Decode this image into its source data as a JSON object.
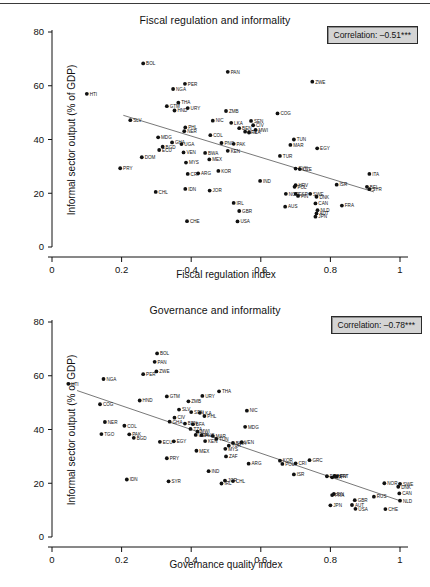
{
  "figure": {
    "top_rule": true,
    "background": "#ffffff",
    "ink": "#111111"
  },
  "chart_data": [
    {
      "type": "scatter",
      "id": "fiscal-regulation-informality",
      "title": "Fiscal regulation and informality",
      "xlabel": "Fiscal regulation index",
      "ylabel": "Informal sector output (% of GDP)",
      "xlim": [
        0,
        1
      ],
      "ylim": [
        0,
        80
      ],
      "xticks": [
        0,
        0.2,
        0.4,
        0.6,
        0.8,
        1
      ],
      "xtick_labels": [
        "0",
        "0.2",
        "0.4",
        "0.6",
        "0.8",
        "1"
      ],
      "yticks": [
        0,
        20,
        40,
        60,
        80
      ],
      "ytick_labels": [
        "0",
        "20",
        "40",
        "60",
        "80"
      ],
      "grid": false,
      "annotation": "Correlation: –0.51***",
      "correlation": -0.51,
      "significance": "***",
      "fit_line": {
        "x0": 0.205,
        "y0": 49.0,
        "x1": 0.925,
        "y1": 20.5
      },
      "points": [
        {
          "label": "HTI",
          "x": 0.1,
          "y": 57.0
        },
        {
          "label": "BOL",
          "x": 0.262,
          "y": 68.3
        },
        {
          "label": "PAN",
          "x": 0.505,
          "y": 65.2
        },
        {
          "label": "ZWE",
          "x": 0.748,
          "y": 61.5
        },
        {
          "label": "PER",
          "x": 0.382,
          "y": 60.7
        },
        {
          "label": "NGA",
          "x": 0.348,
          "y": 58.8
        },
        {
          "label": "THA",
          "x": 0.363,
          "y": 53.7
        },
        {
          "label": "GTM",
          "x": 0.33,
          "y": 52.4
        },
        {
          "label": "URY",
          "x": 0.39,
          "y": 51.7
        },
        {
          "label": "HND",
          "x": 0.352,
          "y": 50.8
        },
        {
          "label": "ZMB",
          "x": 0.5,
          "y": 50.6
        },
        {
          "label": "COG",
          "x": 0.648,
          "y": 49.7
        },
        {
          "label": "SLV",
          "x": 0.225,
          "y": 47.2
        },
        {
          "label": "NIC",
          "x": 0.462,
          "y": 47.0
        },
        {
          "label": "SEN",
          "x": 0.572,
          "y": 46.9
        },
        {
          "label": "LKA",
          "x": 0.515,
          "y": 46.2
        },
        {
          "label": "CIV",
          "x": 0.578,
          "y": 45.3
        },
        {
          "label": "PHL",
          "x": 0.383,
          "y": 44.5
        },
        {
          "label": "BEN",
          "x": 0.538,
          "y": 44.2
        },
        {
          "label": "MWI",
          "x": 0.585,
          "y": 43.6
        },
        {
          "label": "NER",
          "x": 0.38,
          "y": 43.1
        },
        {
          "label": "BFA",
          "x": 0.555,
          "y": 42.9
        },
        {
          "label": "TZA",
          "x": 0.566,
          "y": 42.6
        },
        {
          "label": "COL",
          "x": 0.455,
          "y": 41.6
        },
        {
          "label": "MDG",
          "x": 0.305,
          "y": 40.8
        },
        {
          "label": "TUN",
          "x": 0.695,
          "y": 40.0
        },
        {
          "label": "GHA",
          "x": 0.345,
          "y": 38.9
        },
        {
          "label": "PNG",
          "x": 0.487,
          "y": 38.7
        },
        {
          "label": "PAK",
          "x": 0.522,
          "y": 38.4
        },
        {
          "label": "UGA",
          "x": 0.372,
          "y": 38.3
        },
        {
          "label": "MAR",
          "x": 0.685,
          "y": 38.0
        },
        {
          "label": "BGD",
          "x": 0.318,
          "y": 37.3
        },
        {
          "label": "ECU",
          "x": 0.308,
          "y": 36.1
        },
        {
          "label": "EGY",
          "x": 0.762,
          "y": 36.7
        },
        {
          "label": "KEN",
          "x": 0.505,
          "y": 35.8
        },
        {
          "label": "VEN",
          "x": 0.378,
          "y": 35.2
        },
        {
          "label": "BWA",
          "x": 0.44,
          "y": 35.0
        },
        {
          "label": "TUR",
          "x": 0.655,
          "y": 33.9
        },
        {
          "label": "DOM",
          "x": 0.258,
          "y": 33.4
        },
        {
          "label": "MEX",
          "x": 0.452,
          "y": 32.6
        },
        {
          "label": "MYS",
          "x": 0.385,
          "y": 31.4
        },
        {
          "label": "SVK",
          "x": 0.7,
          "y": 29.2
        },
        {
          "label": "CZE",
          "x": 0.712,
          "y": 29.0
        },
        {
          "label": "PRY",
          "x": 0.196,
          "y": 29.3
        },
        {
          "label": "KOR",
          "x": 0.478,
          "y": 28.3
        },
        {
          "label": "ARG",
          "x": 0.42,
          "y": 27.4
        },
        {
          "label": "CRI",
          "x": 0.39,
          "y": 27.2
        },
        {
          "label": "ITA",
          "x": 0.912,
          "y": 27.2
        },
        {
          "label": "IND",
          "x": 0.598,
          "y": 24.6
        },
        {
          "label": "HRV",
          "x": 0.7,
          "y": 23.0
        },
        {
          "label": "ISR",
          "x": 0.818,
          "y": 23.2
        },
        {
          "label": "BEL",
          "x": 0.905,
          "y": 22.4
        },
        {
          "label": "POL",
          "x": 0.697,
          "y": 22.4
        },
        {
          "label": "SYR",
          "x": 0.912,
          "y": 21.5
        },
        {
          "label": "IDN",
          "x": 0.383,
          "y": 21.6
        },
        {
          "label": "JOR",
          "x": 0.453,
          "y": 21.0
        },
        {
          "label": "CHL",
          "x": 0.298,
          "y": 20.5
        },
        {
          "label": "NOR",
          "x": 0.672,
          "y": 19.8
        },
        {
          "label": "ESP",
          "x": 0.7,
          "y": 19.8
        },
        {
          "label": "SWE",
          "x": 0.742,
          "y": 19.8
        },
        {
          "label": "FIN",
          "x": 0.707,
          "y": 19.0
        },
        {
          "label": "DNK",
          "x": 0.76,
          "y": 18.7
        },
        {
          "label": "IRL",
          "x": 0.522,
          "y": 16.4
        },
        {
          "label": "CAN",
          "x": 0.757,
          "y": 16.2
        },
        {
          "label": "FRA",
          "x": 0.833,
          "y": 15.4
        },
        {
          "label": "AUS",
          "x": 0.67,
          "y": 15.0
        },
        {
          "label": "NLD",
          "x": 0.763,
          "y": 13.7
        },
        {
          "label": "GBR",
          "x": 0.538,
          "y": 13.4
        },
        {
          "label": "AUT",
          "x": 0.76,
          "y": 12.5
        },
        {
          "label": "JPN",
          "x": 0.757,
          "y": 11.3
        },
        {
          "label": "CHE",
          "x": 0.388,
          "y": 9.6
        },
        {
          "label": "USA",
          "x": 0.533,
          "y": 9.5
        }
      ]
    },
    {
      "type": "scatter",
      "id": "governance-informality",
      "title": "Governance and informality",
      "xlabel": "Governance quality index",
      "ylabel": "Informal sector output (% of GDP)",
      "xlim": [
        0,
        1
      ],
      "ylim": [
        0,
        80
      ],
      "xticks": [
        0,
        0.2,
        0.4,
        0.6,
        0.8,
        1
      ],
      "xtick_labels": [
        "0",
        "0.2",
        "0.4",
        "0.6",
        "0.8",
        "1"
      ],
      "yticks": [
        0,
        20,
        40,
        60,
        80
      ],
      "ytick_labels": [
        "0",
        "20",
        "40",
        "60",
        "80"
      ],
      "grid": false,
      "annotation": "Correlation: –0.78***",
      "correlation": -0.78,
      "significance": "***",
      "fit_line": {
        "x0": 0.072,
        "y0": 54.5,
        "x1": 1.0,
        "y1": 13.5
      },
      "points": [
        {
          "label": "HTI",
          "x": 0.047,
          "y": 57.0
        },
        {
          "label": "BOL",
          "x": 0.302,
          "y": 68.3
        },
        {
          "label": "PAN",
          "x": 0.295,
          "y": 65.2
        },
        {
          "label": "ZWE",
          "x": 0.3,
          "y": 61.6
        },
        {
          "label": "PER",
          "x": 0.262,
          "y": 60.6
        },
        {
          "label": "NGA",
          "x": 0.148,
          "y": 58.8
        },
        {
          "label": "THA",
          "x": 0.48,
          "y": 54.2
        },
        {
          "label": "URY",
          "x": 0.432,
          "y": 52.5
        },
        {
          "label": "GTM",
          "x": 0.33,
          "y": 52.3
        },
        {
          "label": "HND",
          "x": 0.252,
          "y": 50.8
        },
        {
          "label": "ZMB",
          "x": 0.392,
          "y": 50.5
        },
        {
          "label": "COG",
          "x": 0.138,
          "y": 49.4
        },
        {
          "label": "SLV",
          "x": 0.365,
          "y": 47.4
        },
        {
          "label": "SEN",
          "x": 0.4,
          "y": 46.5
        },
        {
          "label": "NIC",
          "x": 0.56,
          "y": 47.0
        },
        {
          "label": "LKA",
          "x": 0.425,
          "y": 46.2
        },
        {
          "label": "PHL",
          "x": 0.438,
          "y": 45.0
        },
        {
          "label": "CIV",
          "x": 0.352,
          "y": 44.4
        },
        {
          "label": "GHA",
          "x": 0.338,
          "y": 42.9
        },
        {
          "label": "NER",
          "x": 0.152,
          "y": 42.8
        },
        {
          "label": "BEN",
          "x": 0.382,
          "y": 42.2
        },
        {
          "label": "BFA",
          "x": 0.405,
          "y": 42.0
        },
        {
          "label": "COL",
          "x": 0.208,
          "y": 41.4
        },
        {
          "label": "MDG",
          "x": 0.555,
          "y": 41.0
        },
        {
          "label": "TZA",
          "x": 0.398,
          "y": 40.2
        },
        {
          "label": "MWI",
          "x": 0.418,
          "y": 39.2
        },
        {
          "label": "TGO",
          "x": 0.142,
          "y": 38.3
        },
        {
          "label": "PAK",
          "x": 0.222,
          "y": 38.2
        },
        {
          "label": "UGA",
          "x": 0.413,
          "y": 38.0
        },
        {
          "label": "PNG",
          "x": 0.43,
          "y": 37.9
        },
        {
          "label": "MAR",
          "x": 0.462,
          "y": 37.6
        },
        {
          "label": "BGD",
          "x": 0.235,
          "y": 36.9
        },
        {
          "label": "ECU",
          "x": 0.31,
          "y": 35.4
        },
        {
          "label": "EGY",
          "x": 0.35,
          "y": 35.6
        },
        {
          "label": "TUN",
          "x": 0.472,
          "y": 36.5
        },
        {
          "label": "KEN",
          "x": 0.44,
          "y": 35.7
        },
        {
          "label": "VEN",
          "x": 0.545,
          "y": 35.3
        },
        {
          "label": "BWA",
          "x": 0.52,
          "y": 35.0
        },
        {
          "label": "TUR",
          "x": 0.508,
          "y": 34.0
        },
        {
          "label": "MYS",
          "x": 0.498,
          "y": 32.8
        },
        {
          "label": "MEX",
          "x": 0.415,
          "y": 32.1
        },
        {
          "label": "ZAF",
          "x": 0.5,
          "y": 30.0
        },
        {
          "label": "PRY",
          "x": 0.33,
          "y": 29.3
        },
        {
          "label": "KOR",
          "x": 0.655,
          "y": 28.4
        },
        {
          "label": "GRC",
          "x": 0.74,
          "y": 28.6
        },
        {
          "label": "CRI",
          "x": 0.7,
          "y": 27.4
        },
        {
          "label": "POL",
          "x": 0.662,
          "y": 27.2
        },
        {
          "label": "ARG",
          "x": 0.565,
          "y": 27.3
        },
        {
          "label": "IND",
          "x": 0.45,
          "y": 24.5
        },
        {
          "label": "ISR",
          "x": 0.695,
          "y": 23.3
        },
        {
          "label": "HRV",
          "x": 0.812,
          "y": 22.7
        },
        {
          "label": "ESP",
          "x": 0.79,
          "y": 22.6
        },
        {
          "label": "PRT",
          "x": 0.818,
          "y": 22.5
        },
        {
          "label": "ITA",
          "x": 0.805,
          "y": 22.2
        },
        {
          "label": "IDN",
          "x": 0.215,
          "y": 21.4
        },
        {
          "label": "SYR",
          "x": 0.335,
          "y": 20.7
        },
        {
          "label": "CHL",
          "x": 0.52,
          "y": 20.8
        },
        {
          "label": "JOR",
          "x": 0.497,
          "y": 21.0
        },
        {
          "label": "IRL",
          "x": 0.487,
          "y": 19.9
        },
        {
          "label": "NOR",
          "x": 0.955,
          "y": 20.0
        },
        {
          "label": "SWE",
          "x": 1.0,
          "y": 19.8
        },
        {
          "label": "DNK",
          "x": 0.995,
          "y": 18.7
        },
        {
          "label": "FIN",
          "x": 0.81,
          "y": 16.0
        },
        {
          "label": "FRA",
          "x": 0.805,
          "y": 15.6
        },
        {
          "label": "CAN",
          "x": 0.998,
          "y": 16.2
        },
        {
          "label": "RUS",
          "x": 0.925,
          "y": 15.0
        },
        {
          "label": "GBR",
          "x": 0.87,
          "y": 13.7
        },
        {
          "label": "NLD",
          "x": 1.0,
          "y": 13.5
        },
        {
          "label": "AUT",
          "x": 0.862,
          "y": 11.9
        },
        {
          "label": "JPN",
          "x": 0.8,
          "y": 11.8
        },
        {
          "label": "USA",
          "x": 0.872,
          "y": 10.5
        },
        {
          "label": "CHE",
          "x": 0.958,
          "y": 10.4
        }
      ]
    }
  ]
}
